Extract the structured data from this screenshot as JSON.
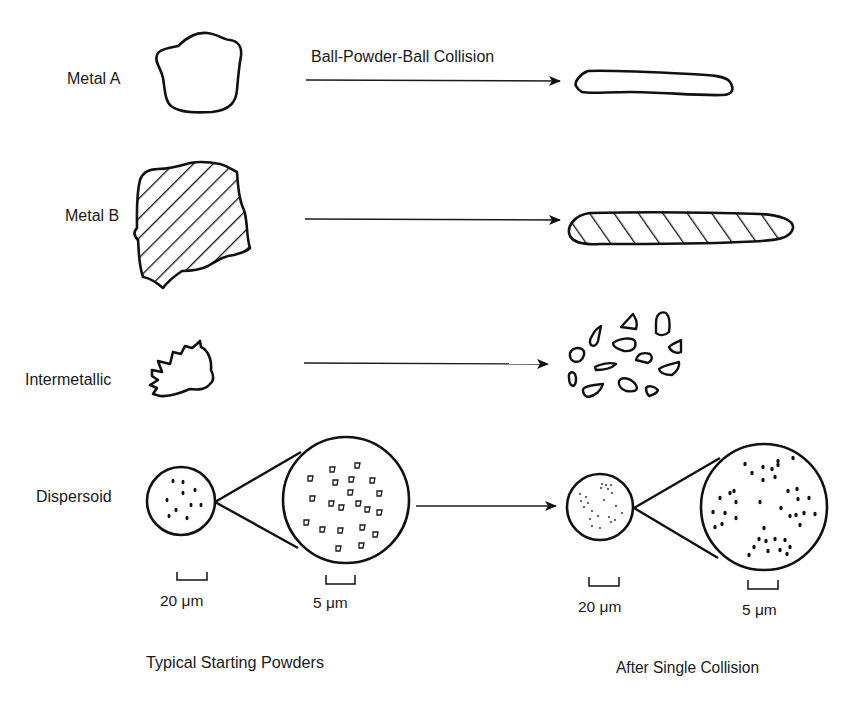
{
  "figure": {
    "process_label": "Ball-Powder-Ball Collision",
    "rows": [
      {
        "id": "metal-a",
        "label": "Metal A"
      },
      {
        "id": "metal-b",
        "label": "Metal B"
      },
      {
        "id": "intermetallic",
        "label": "Intermetallic"
      },
      {
        "id": "dispersoid",
        "label": "Dispersoid"
      }
    ],
    "scale_bars": {
      "before_small": "20 μm",
      "before_zoom": "5 μm",
      "after_small": "20 μm",
      "after_zoom": "5 μm"
    },
    "captions": {
      "left": "Typical Starting Powders",
      "right": "After Single Collision"
    },
    "colors": {
      "ink": "#111111",
      "background": "#ffffff"
    }
  }
}
